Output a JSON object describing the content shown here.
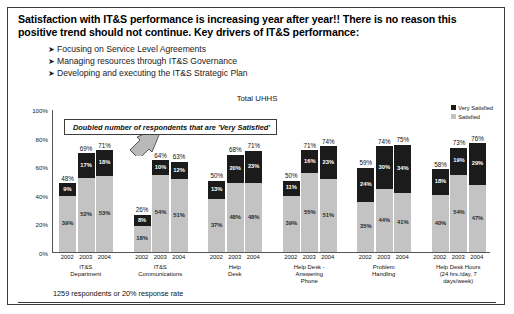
{
  "headline": "Satisfaction with IT&S performance is increasing year after year!!  There is no reason this positive trend should not continue.  Key drivers of IT&S performance:",
  "bullet_marker": "➤",
  "bullets": [
    "Focusing on Service Level Agreements",
    "Managing resources through IT&S Governance",
    "Developing and executing the IT&S Strategic Plan"
  ],
  "callout": "Doubled number of respondents that are 'Very Satisfied'",
  "footer": "1259 respondents or 20% response rate",
  "colors": {
    "very_satisfied": "#1b1b1b",
    "satisfied": "#c3c3c3",
    "frame": "#3a3a3a",
    "axis": "#555555"
  },
  "chart_data": {
    "type": "bar",
    "stacked": true,
    "title": "Total UHHS",
    "xlabel": "",
    "ylabel": "",
    "ylim": [
      0,
      100
    ],
    "yticks": [
      "0%",
      "20%",
      "40%",
      "60%",
      "80%",
      "100%"
    ],
    "grid": false,
    "legend_position": "top-right",
    "legend": [
      "Very Satisfied",
      "Satisfied"
    ],
    "series": [
      {
        "name": "Very Satisfied",
        "values": [
          9,
          17,
          18,
          8,
          10,
          12,
          13,
          20,
          23,
          11,
          16,
          23,
          24,
          30,
          34,
          18,
          19,
          29
        ]
      },
      {
        "name": "Satisfied",
        "values": [
          39,
          52,
          53,
          18,
          54,
          51,
          37,
          48,
          48,
          39,
          55,
          51,
          35,
          44,
          41,
          40,
          54,
          47
        ]
      }
    ],
    "groups": [
      {
        "category": "IT&S Department",
        "category_lines": [
          "IT&S",
          "Department"
        ],
        "bars": [
          {
            "year": "2002",
            "total": "48%",
            "very_satisfied": "9%",
            "satisfied": "39%",
            "vs_value": 9,
            "s_value": 39,
            "total_value": 48
          },
          {
            "year": "2003",
            "total": "69%",
            "very_satisfied": "17%",
            "satisfied": "52%",
            "vs_value": 17,
            "s_value": 52,
            "total_value": 69
          },
          {
            "year": "2004",
            "total": "71%",
            "very_satisfied": "18%",
            "satisfied": "53%",
            "vs_value": 18,
            "s_value": 53,
            "total_value": 71
          }
        ]
      },
      {
        "category": "IT&S Communications",
        "category_lines": [
          "IT&S",
          "Communications"
        ],
        "bars": [
          {
            "year": "2002",
            "total": "26%",
            "very_satisfied": "8%",
            "satisfied": "18%",
            "vs_value": 8,
            "s_value": 18,
            "total_value": 26
          },
          {
            "year": "2003",
            "total": "64%",
            "very_satisfied": "10%",
            "satisfied": "54%",
            "vs_value": 10,
            "s_value": 54,
            "total_value": 64
          },
          {
            "year": "2004",
            "total": "63%",
            "very_satisfied": "12%",
            "satisfied": "51%",
            "vs_value": 12,
            "s_value": 51,
            "total_value": 63
          }
        ]
      },
      {
        "category": "Help Desk",
        "category_lines": [
          "Help",
          "Desk"
        ],
        "bars": [
          {
            "year": "2002",
            "total": "50%",
            "very_satisfied": "13%",
            "satisfied": "37%",
            "vs_value": 13,
            "s_value": 37,
            "total_value": 50
          },
          {
            "year": "2003",
            "total": "68%",
            "very_satisfied": "20%",
            "satisfied": "48%",
            "vs_value": 20,
            "s_value": 48,
            "total_value": 68
          },
          {
            "year": "2004",
            "total": "71%",
            "very_satisfied": "23%",
            "satisfied": "48%",
            "vs_value": 23,
            "s_value": 48,
            "total_value": 71
          }
        ]
      },
      {
        "category": "Help Desk - Answering Phone",
        "category_lines": [
          "Help Desk -",
          "Answering",
          "Phone"
        ],
        "bars": [
          {
            "year": "2002",
            "total": "50%",
            "very_satisfied": "11%",
            "satisfied": "39%",
            "vs_value": 11,
            "s_value": 39,
            "total_value": 50
          },
          {
            "year": "2003",
            "total": "71%",
            "very_satisfied": "16%",
            "satisfied": "55%",
            "vs_value": 16,
            "s_value": 55,
            "total_value": 71
          },
          {
            "year": "2004",
            "total": "74%",
            "very_satisfied": "23%",
            "satisfied": "51%",
            "vs_value": 23,
            "s_value": 51,
            "total_value": 74
          }
        ]
      },
      {
        "category": "Problem Handling",
        "category_lines": [
          "Problem",
          "Handling"
        ],
        "bars": [
          {
            "year": "2002",
            "total": "59%",
            "very_satisfied": "24%",
            "satisfied": "35%",
            "vs_value": 24,
            "s_value": 35,
            "total_value": 59
          },
          {
            "year": "2003",
            "total": "74%",
            "very_satisfied": "30%",
            "satisfied": "44%",
            "vs_value": 30,
            "s_value": 44,
            "total_value": 74
          },
          {
            "year": "2004",
            "total": "75%",
            "very_satisfied": "34%",
            "satisfied": "41%",
            "vs_value": 34,
            "s_value": 41,
            "total_value": 75
          }
        ]
      },
      {
        "category": "Help Desk Hours (24 hrs./day, 7 days/week)",
        "category_lines": [
          "Help Desk Hours",
          "(24 hrs./day, 7",
          "days/week)"
        ],
        "bars": [
          {
            "year": "2002",
            "total": "58%",
            "very_satisfied": "18%",
            "satisfied": "40%",
            "vs_value": 18,
            "s_value": 40,
            "total_value": 58
          },
          {
            "year": "2003",
            "total": "73%",
            "very_satisfied": "19%",
            "satisfied": "54%",
            "vs_value": 19,
            "s_value": 54,
            "total_value": 73
          },
          {
            "year": "2004",
            "total": "76%",
            "very_satisfied": "29%",
            "satisfied": "47%",
            "vs_value": 29,
            "s_value": 47,
            "total_value": 76
          }
        ]
      }
    ]
  }
}
